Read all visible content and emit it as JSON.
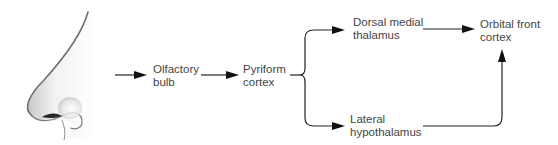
{
  "diagram": {
    "nodes": {
      "nose": {
        "label": "",
        "icon": "nose-illustration"
      },
      "olfactory_bulb": {
        "label": "Olfactory\nbulb"
      },
      "pyriform_cortex": {
        "label": "Pyriform\ncortex"
      },
      "dorsal_medial_thalamus": {
        "label": "Dorsal medial\nthalamus"
      },
      "lateral_hypothalamus": {
        "label": "Lateral\nhypothalamus"
      },
      "orbital_front_cortex": {
        "label": "Orbital front\ncortex"
      }
    },
    "edges": [
      {
        "from": "nose",
        "to": "olfactory_bulb"
      },
      {
        "from": "olfactory_bulb",
        "to": "pyriform_cortex"
      },
      {
        "from": "pyriform_cortex",
        "to": "dorsal_medial_thalamus"
      },
      {
        "from": "pyriform_cortex",
        "to": "lateral_hypothalamus"
      },
      {
        "from": "dorsal_medial_thalamus",
        "to": "orbital_front_cortex"
      },
      {
        "from": "lateral_hypothalamus",
        "to": "orbital_front_cortex"
      }
    ],
    "colors": {
      "line": "#222222",
      "text": "#444444",
      "background": "#ffffff"
    }
  }
}
